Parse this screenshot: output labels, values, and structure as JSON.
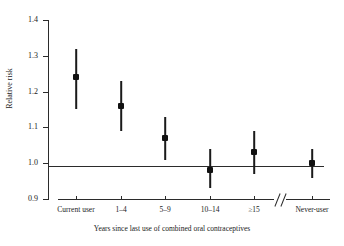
{
  "chart_data": {
    "type": "scatter",
    "title": "",
    "subtitle": "",
    "xlabel": "Years since last use of combined oral contraceptives",
    "ylabel": "Relative risk",
    "categories": [
      "Current user",
      "1–4",
      "5–9",
      "10–14",
      "≥15",
      "Never-user"
    ],
    "values": [
      1.24,
      1.16,
      1.07,
      0.98,
      1.03,
      1.0
    ],
    "ci_lower": [
      1.15,
      1.09,
      1.01,
      0.93,
      0.97,
      0.96
    ],
    "ci_upper": [
      1.32,
      1.23,
      1.13,
      1.04,
      1.09,
      1.04
    ],
    "yticks": [
      "0.9",
      "1.0",
      "1.1",
      "1.2",
      "1.3",
      "1.4"
    ],
    "ytick_values": [
      0.9,
      1.0,
      1.1,
      1.2,
      1.3,
      1.4
    ],
    "ylim": [
      0.9,
      1.4
    ],
    "reference_line": 1.0,
    "grid": false,
    "legend": "none",
    "axis_break": "//",
    "marker": "filled-square"
  },
  "axes": {
    "y_title": "Relative risk",
    "x_title": "Years since last use of combined oral contraceptives"
  }
}
